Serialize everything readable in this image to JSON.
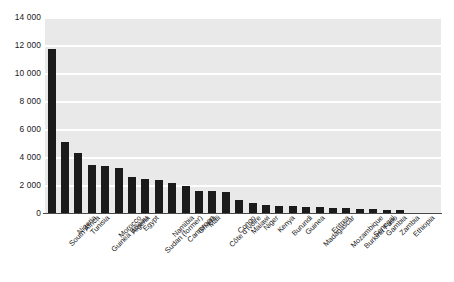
{
  "chart_data": {
    "type": "bar",
    "title": "",
    "subtitle": "",
    "xlabel": "",
    "ylabel": "",
    "ylim": [
      0,
      14000
    ],
    "grid": true,
    "legend": false,
    "legend_position": "none",
    "bar_color": "#1b1b1b",
    "plot_background": "#e9e9e9",
    "gridline_color": "#ffffff",
    "y_ticks": [
      0,
      2000,
      4000,
      6000,
      8000,
      10000,
      12000,
      14000
    ],
    "y_tick_labels": [
      "0",
      "2 000",
      "4 000",
      "6 000",
      "8 000",
      "10 000",
      "12 000",
      "14 000"
    ],
    "categories": [
      "South Africa",
      "Nigeria",
      "Tunisia",
      "Guinea Bissau",
      "Morocco",
      "Algeria",
      "Egypt",
      "Sudan (former)",
      "Namibia",
      "Cameroon",
      "Ghana",
      "Mali",
      "Côte d'Ivoire",
      "Congo",
      "Malawi",
      "Niger",
      "Kenya",
      "Burundi",
      "Guinea",
      "Madagascar",
      "Eritrea",
      "Mozambique",
      "Burkina Faso",
      "Senegal",
      "Gambia",
      "Zambia",
      "Ethiopia"
    ],
    "values": [
      11750,
      5100,
      4300,
      3400,
      3350,
      3250,
      2600,
      2450,
      2350,
      2150,
      1950,
      1600,
      1550,
      1500,
      900,
      700,
      600,
      520,
      470,
      430,
      400,
      360,
      330,
      300,
      260,
      230,
      200
    ]
  }
}
